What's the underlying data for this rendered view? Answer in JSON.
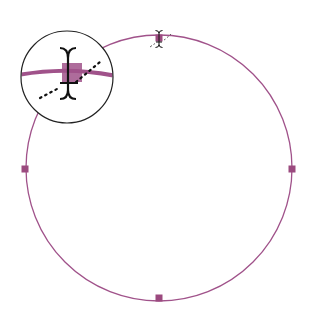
{
  "diagram": {
    "type": "circle-path-with-anchor-points",
    "colors": {
      "path": "#a0528a",
      "anchor": "#9b4a7f",
      "cursor": "#111111",
      "magnifier_ring": "#222222",
      "background": "#ffffff"
    },
    "circle": {
      "cx": 159,
      "cy": 168,
      "r": 133
    },
    "anchors": [
      {
        "name": "top",
        "x": 159,
        "y": 38
      },
      {
        "name": "right",
        "x": 292,
        "y": 169
      },
      {
        "name": "bottom",
        "x": 159,
        "y": 298
      },
      {
        "name": "left",
        "x": 25,
        "y": 169
      }
    ],
    "cursor": {
      "icon": "text-ibeam-cursor",
      "x": 159,
      "y": 38
    },
    "magnifier": {
      "cx": 67,
      "cy": 77,
      "r": 46,
      "zoom": 3
    }
  }
}
